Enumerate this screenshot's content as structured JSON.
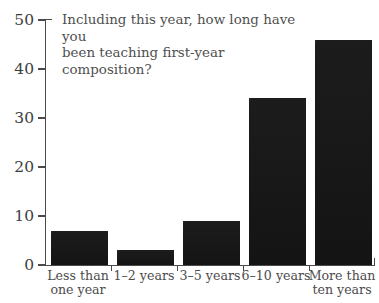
{
  "chart_data": {
    "type": "bar",
    "title": "Including this year, how long have you\nbeen teaching first-year composition?",
    "xlabel": "",
    "ylabel": "",
    "categories": [
      "Less than\none year",
      "1–2 years",
      "3–5 years",
      "6–10 years",
      "More than\nten years"
    ],
    "values": [
      7,
      3,
      9,
      34,
      46
    ],
    "ylim": [
      0,
      50
    ],
    "yticks": [
      0,
      10,
      20,
      30,
      40,
      50
    ],
    "ytick_labels": [
      "0",
      "10",
      "20",
      "30",
      "40",
      "50"
    ],
    "grid": false,
    "legend": false,
    "bar_color": "#1a1a1a",
    "axis_color": "#4a4a4a",
    "text_color": "#4c4c4c"
  },
  "axis": {
    "y_labels": [
      "50",
      "40",
      "30",
      "20",
      "10",
      "0"
    ]
  }
}
